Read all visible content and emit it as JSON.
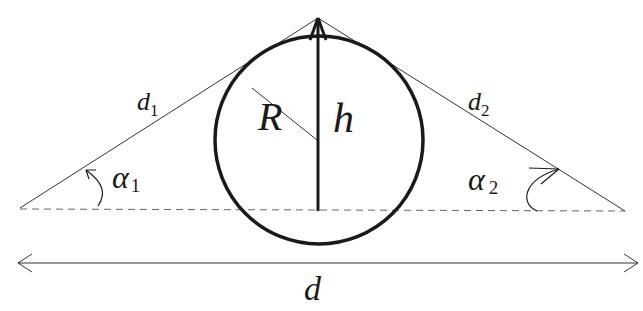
{
  "diagram": {
    "colors": {
      "stroke": "#1a1a1a",
      "dash": "#666666",
      "background": "#ffffff"
    },
    "labels": {
      "d1": {
        "main": "d",
        "sub": "1"
      },
      "d2": {
        "main": "d",
        "sub": "2"
      },
      "R": "R",
      "h": "h",
      "alpha1": {
        "main": "α",
        "sub": "1"
      },
      "alpha2": {
        "main": "α",
        "sub": "2"
      },
      "d": "d"
    },
    "geometry": {
      "apex": [
        318,
        18
      ],
      "left_point": [
        20,
        208
      ],
      "right_point": [
        625,
        211
      ],
      "circle_center": [
        319,
        140
      ],
      "circle_radius": 104,
      "baseline_y": 210,
      "h_bottom": [
        318,
        210
      ],
      "radius_line_from": [
        252,
        88
      ],
      "radius_line_to": [
        316,
        140
      ],
      "dimension_arrow_y": 263,
      "dimension_arrow_x": [
        18,
        638
      ]
    }
  }
}
